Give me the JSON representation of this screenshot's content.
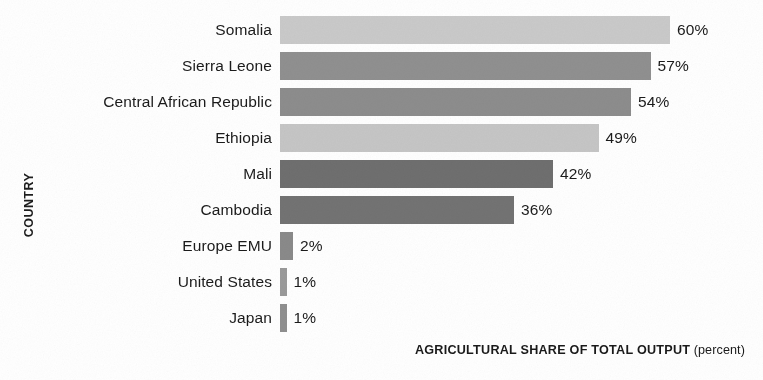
{
  "chart_data": {
    "type": "bar",
    "orientation": "horizontal",
    "title": "",
    "xlabel": "AGRICULTURAL SHARE OF TOTAL OUTPUT",
    "xlabel_unit": "(percent)",
    "ylabel": "COUNTRY",
    "grid": false,
    "legend": "none",
    "xlim": [
      0,
      60
    ],
    "value_suffix": "%",
    "categories": [
      "Somalia",
      "Sierra Leone",
      "Central African Republic",
      "Ethiopia",
      "Mali",
      "Cambodia",
      "Europe EMU",
      "United States",
      "Japan"
    ],
    "values": [
      60,
      57,
      54,
      49,
      42,
      36,
      2,
      1,
      1
    ],
    "value_labels": [
      "60%",
      "57%",
      "54%",
      "49%",
      "42%",
      "36%",
      "2%",
      "1%",
      "1%"
    ],
    "bar_colors": [
      "#cacaca",
      "#909090",
      "#8d8d8d",
      "#c6c6c6",
      "#6f6f6f",
      "#737373",
      "#8a8a8a",
      "#9a9a9a",
      "#8f8f8f"
    ]
  },
  "style": {
    "background": "#ffffff",
    "text_color": "#1b1b1b",
    "px_per_percent": 6.5,
    "bar_origin_x": 280
  }
}
